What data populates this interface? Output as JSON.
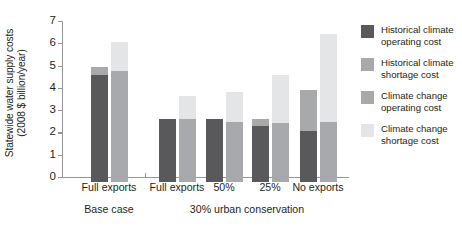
{
  "chart_data": {
    "type": "bar",
    "title": "",
    "xlabel": "",
    "ylabel": "Statewide water supply costs (2008 $ billion/year)",
    "ylabel_line1": "Statewide water supply costs",
    "ylabel_line2": "(2008 $ billion/year)",
    "ylim": [
      0,
      7
    ],
    "yticks": [
      0,
      1,
      2,
      3,
      4,
      5,
      6,
      7
    ],
    "grid": false,
    "legend_position": "right",
    "stacked": true,
    "categories": [
      "Full exports",
      "Full exports",
      "50%",
      "25%",
      "No exports"
    ],
    "group_labels": [
      "Base case",
      "30% urban conservation"
    ],
    "group_spans": [
      1,
      4
    ],
    "series": [
      {
        "name": "Historical climate operating cost",
        "color": "#59595b",
        "pair": "historical",
        "stack": "operating",
        "values": [
          4.8,
          2.85,
          2.85,
          2.5,
          2.3
        ]
      },
      {
        "name": "Historical climate shortage cost",
        "color": "#a8a9ab",
        "pair": "historical",
        "stack": "shortage",
        "values": [
          0.35,
          0.0,
          0.0,
          0.35,
          1.85
        ]
      },
      {
        "name": "Climate change operating cost",
        "color": "#a7a9ac",
        "pair": "climate_change",
        "stack": "operating",
        "values": [
          5.0,
          2.85,
          2.7,
          2.65,
          2.7
        ]
      },
      {
        "name": "Climate change shortage cost",
        "color": "#e4e5e6",
        "pair": "climate_change",
        "stack": "shortage",
        "values": [
          1.3,
          1.0,
          1.35,
          2.15,
          3.95
        ]
      }
    ],
    "bar_totals": {
      "historical": [
        5.15,
        2.85,
        2.85,
        2.85,
        4.15
      ],
      "climate_change": [
        6.3,
        3.85,
        4.05,
        4.8,
        6.65
      ]
    }
  },
  "legend": {
    "items": [
      {
        "label_line1": "Historical climate",
        "label_line2": "operating cost",
        "color": "#59595b"
      },
      {
        "label_line1": "Historical climate",
        "label_line2": "shortage cost",
        "color": "#a8a9ab"
      },
      {
        "label_line1": "Climate change",
        "label_line2": "operating cost",
        "color": "#a7a9ac"
      },
      {
        "label_line1": "Climate change",
        "label_line2": "shortage cost",
        "color": "#e4e5e6"
      }
    ]
  }
}
